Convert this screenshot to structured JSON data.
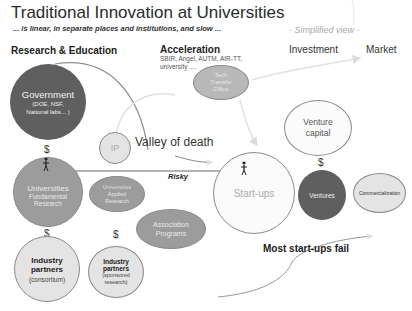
{
  "header": {
    "title": "Traditional Innovation at Universities",
    "subtitle": "... is linear, in separate places and institutions, and slow ...",
    "view_note": "- Simplified view -"
  },
  "columns": {
    "research": "Research & Education",
    "acceleration": "Acceleration",
    "acceleration_note": "SBIR, Angel, AUTM, AIR-TT, university ....",
    "investment": "Investment",
    "market": "Market"
  },
  "nodes": {
    "government": {
      "title": "Government",
      "detail": "(DOE, NSF, National labs... )"
    },
    "tech_transfer": {
      "line1": "Tech",
      "line2": "Transfer",
      "line3": "Office"
    },
    "ip": {
      "label": "IP"
    },
    "universities_fundamental": {
      "title": "Universities",
      "detail1": "Fundamental",
      "detail2": "Research"
    },
    "universities_applied": {
      "title": "Universities",
      "detail1": "Applied",
      "detail2": "Research"
    },
    "association_programs": {
      "line1": "Association",
      "line2": "Programs"
    },
    "industry_consortium": {
      "title1": "Industry",
      "title2": "partners",
      "detail": "(consortium)"
    },
    "industry_sponsored": {
      "title1": "Industry",
      "title2": "partners",
      "detail1": "(sponsored",
      "detail2": "research)"
    },
    "startups": {
      "label": "Start-ups"
    },
    "venture_capital": {
      "line1": "Venture",
      "line2": "capital"
    },
    "ventures": {
      "label": "Ventures"
    },
    "commercialization": {
      "label": "Commercialization"
    }
  },
  "annotations": {
    "valley": "Valley of death",
    "risky": "Risky",
    "fail": "Most start-ups fail",
    "dollar": "$"
  },
  "colors": {
    "dark": "#5f5f5f",
    "mid": "#9c9c9c",
    "light": "#e4e4e4",
    "arrow": "#999999"
  }
}
